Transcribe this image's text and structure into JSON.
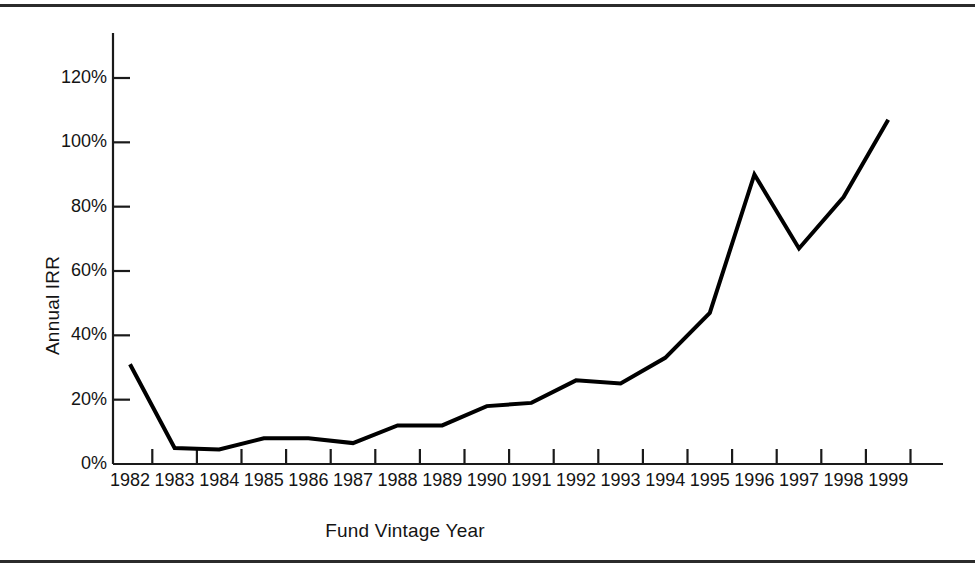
{
  "chart_data": {
    "type": "line",
    "title": "",
    "xlabel": "Fund Vintage Year",
    "ylabel": "Annual IRR",
    "categories": [
      "1982",
      "1983",
      "1984",
      "1985",
      "1986",
      "1987",
      "1988",
      "1989",
      "1990",
      "1991",
      "1992",
      "1993",
      "1994",
      "1995",
      "1996",
      "1997",
      "1998",
      "1999"
    ],
    "values": [
      31,
      5,
      4.5,
      8,
      8,
      6.5,
      12,
      12,
      18,
      19,
      26,
      25,
      33,
      47,
      90,
      67,
      83,
      107
    ],
    "series": [
      {
        "name": "Annual IRR",
        "values": [
          31,
          5,
          4.5,
          8,
          8,
          6.5,
          12,
          12,
          18,
          19,
          26,
          25,
          33,
          47,
          90,
          67,
          83,
          107
        ]
      }
    ],
    "ylim": [
      0,
      130
    ],
    "xlim": [
      "1982",
      "1999"
    ],
    "ytick_labels": [
      "0%",
      "20%",
      "40%",
      "60%",
      "80%",
      "100%",
      "120%"
    ],
    "ytick_values": [
      0,
      20,
      40,
      60,
      80,
      100,
      120
    ],
    "grid": false,
    "legend": false,
    "legend_position": "none",
    "line_color": "#000000",
    "line_width": 4,
    "background_color": "#ffffff",
    "axis_color": "#1a1a1a",
    "markers": false,
    "value_suffix": "%"
  },
  "figure": {
    "border_color": "#2b2b2b",
    "has_top_rule": true,
    "has_bottom_rule": true
  }
}
